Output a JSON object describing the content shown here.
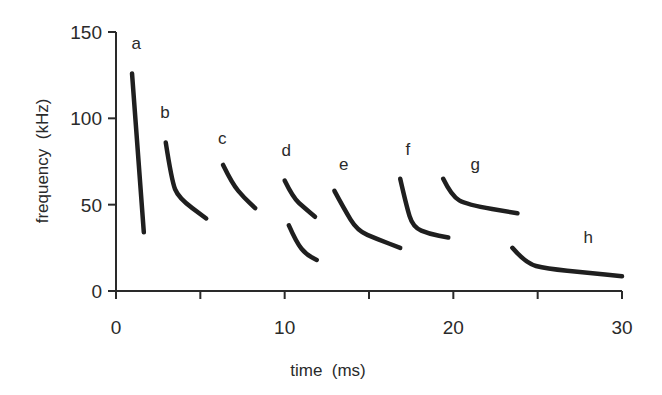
{
  "chart_data": {
    "type": "line",
    "title": "",
    "xlabel": "time  (ms)",
    "ylabel": "frequency  (kHz)",
    "xlim": [
      0,
      30
    ],
    "ylim": [
      0,
      150
    ],
    "xticks": [
      0,
      5,
      10,
      15,
      20,
      25,
      30
    ],
    "xtick_labels": [
      "0",
      "",
      "10",
      "",
      "20",
      "",
      "30"
    ],
    "yticks": [
      0,
      50,
      100,
      150
    ],
    "ytick_labels": [
      "0",
      "50",
      "100",
      "150"
    ],
    "grid": false,
    "legend": "none",
    "series": [
      {
        "name": "a",
        "label_pos": [
          1.2,
          140
        ],
        "points": [
          [
            0.95,
            126
          ],
          [
            1.65,
            34
          ]
        ]
      },
      {
        "name": "b",
        "label_pos": [
          2.9,
          100
        ],
        "points": [
          [
            2.95,
            86
          ],
          [
            3.3,
            64
          ],
          [
            3.7,
            54
          ],
          [
            5.35,
            42
          ]
        ]
      },
      {
        "name": "c",
        "label_pos": [
          6.3,
          85
        ],
        "points": [
          [
            6.35,
            73
          ],
          [
            6.9,
            62
          ],
          [
            7.6,
            54
          ],
          [
            8.25,
            48
          ]
        ]
      },
      {
        "name": "d",
        "label_pos": [
          10.1,
          78
        ],
        "points": [
          [
            10.0,
            64
          ],
          [
            10.5,
            54
          ],
          [
            11.2,
            48
          ],
          [
            11.8,
            43
          ]
        ]
      },
      {
        "name": "d2",
        "label_pos": null,
        "points": [
          [
            10.25,
            38
          ],
          [
            10.7,
            28
          ],
          [
            11.3,
            21
          ],
          [
            11.9,
            18
          ]
        ]
      },
      {
        "name": "e",
        "label_pos": [
          13.5,
          70
        ],
        "points": [
          [
            12.95,
            58
          ],
          [
            13.5,
            48
          ],
          [
            14.3,
            35
          ],
          [
            15.5,
            30
          ],
          [
            16.85,
            25
          ]
        ]
      },
      {
        "name": "f",
        "label_pos": [
          17.3,
          79
        ],
        "points": [
          [
            16.85,
            65
          ],
          [
            17.2,
            50
          ],
          [
            17.6,
            37
          ],
          [
            18.6,
            33
          ],
          [
            19.7,
            31
          ]
        ]
      },
      {
        "name": "g",
        "label_pos": [
          21.3,
          70
        ],
        "points": [
          [
            19.4,
            65
          ],
          [
            19.9,
            55
          ],
          [
            20.8,
            50
          ],
          [
            23.8,
            45
          ]
        ]
      },
      {
        "name": "h",
        "label_pos": [
          28.0,
          28
        ],
        "points": [
          [
            23.5,
            25
          ],
          [
            24.3,
            16
          ],
          [
            25.5,
            13
          ],
          [
            28.0,
            10.5
          ],
          [
            30.0,
            8.5
          ]
        ]
      }
    ]
  }
}
